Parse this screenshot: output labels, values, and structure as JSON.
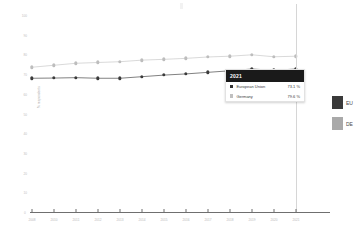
{
  "chart_data": {
    "type": "line",
    "title": "",
    "xlabel": "",
    "ylabel": "% respondents",
    "ylim": [
      0,
      100
    ],
    "yticks": [
      100,
      90,
      80,
      70,
      60,
      50,
      40,
      30,
      20,
      10,
      0
    ],
    "grid": false,
    "legend_position": "right",
    "categories": [
      "2008",
      "2010",
      "2011",
      "2012",
      "2013",
      "2014",
      "2015",
      "2016",
      "2017",
      "2018",
      "2019",
      "2020",
      "2021"
    ],
    "series": [
      {
        "name": "European Union",
        "short": "EU",
        "color": "#3a3a3a",
        "values": [
          68.4,
          68.5,
          68.7,
          68.4,
          68.4,
          69.2,
          70.0,
          70.6,
          71.4,
          72.2,
          73.1,
          72.4,
          73.1
        ]
      },
      {
        "name": "Germany",
        "short": "DE",
        "color": "#a9a9a9",
        "values": [
          74.0,
          75.0,
          76.0,
          76.4,
          76.8,
          77.6,
          78.0,
          78.5,
          79.2,
          79.6,
          80.3,
          79.3,
          79.6
        ]
      }
    ]
  },
  "tooltip": {
    "year": "2021",
    "rows": [
      {
        "name": "European Union",
        "value": "73.1 %"
      },
      {
        "name": "Germany",
        "value": "79.6 %"
      }
    ]
  },
  "legend": {
    "items": [
      {
        "label": "EU"
      },
      {
        "label": "DE"
      }
    ]
  }
}
